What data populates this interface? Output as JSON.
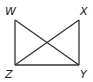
{
  "diagram": {
    "type": "rectangle-with-diagonals",
    "stroke_color": "#333333",
    "vertices": [
      {
        "name": "W",
        "x": 15,
        "y": 20,
        "label_x": 5,
        "label_y": 15
      },
      {
        "name": "X",
        "x": 79,
        "y": 20,
        "label_x": 80,
        "label_y": 15
      },
      {
        "name": "Y",
        "x": 79,
        "y": 65,
        "label_x": 80,
        "label_y": 78
      },
      {
        "name": "Z",
        "x": 15,
        "y": 65,
        "label_x": 5,
        "label_y": 78
      }
    ],
    "segments": [
      {
        "from": "W",
        "to": "Z"
      },
      {
        "from": "X",
        "to": "Y"
      },
      {
        "from": "Z",
        "to": "Y"
      },
      {
        "from": "W",
        "to": "Y"
      },
      {
        "from": "X",
        "to": "Z"
      }
    ],
    "labels": {
      "W": "W",
      "X": "X",
      "Y": "Y",
      "Z": "Z"
    }
  }
}
